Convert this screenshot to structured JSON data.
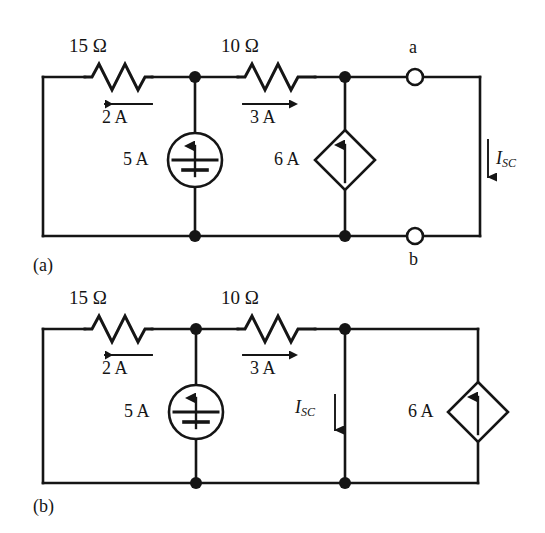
{
  "figure": {
    "type": "circuit-diagram",
    "background": "#ffffff",
    "ink": "#151515",
    "panels": [
      {
        "tag": "(a)",
        "name": "circuit-a",
        "description": "Circuit with open terminals a-b and short-circuit current I_SC in the right branch",
        "components": [
          {
            "name": "resistor-15-ohm",
            "label": "15 Ω",
            "current_label": "2 A",
            "current_direction": "left"
          },
          {
            "name": "resistor-10-ohm",
            "label": "10 Ω",
            "current_label": "3 A",
            "current_direction": "right"
          },
          {
            "name": "independent-current-source",
            "label": "5 A",
            "symbol": "circle-battery-arrow",
            "arrow_direction": "up"
          },
          {
            "name": "dependent-current-source",
            "label": "6 A",
            "symbol": "diamond-arrow",
            "arrow_direction": "up"
          }
        ],
        "terminals": [
          {
            "name": "terminal-a",
            "label": "a"
          },
          {
            "name": "terminal-b",
            "label": "b"
          }
        ],
        "branch_current": {
          "name": "isc-right-branch",
          "label": "I",
          "subscript": "SC",
          "arrow_direction": "down",
          "label_side": "right"
        }
      },
      {
        "tag": "(b)",
        "name": "circuit-b",
        "description": "Same circuit with terminals shorted; I_SC flows in the shorting branch and the 6 A dependent source moved to the far right",
        "components": [
          {
            "name": "resistor-15-ohm",
            "label": "15 Ω",
            "current_label": "2 A",
            "current_direction": "left"
          },
          {
            "name": "resistor-10-ohm",
            "label": "10 Ω",
            "current_label": "3 A",
            "current_direction": "right"
          },
          {
            "name": "independent-current-source",
            "label": "5 A",
            "symbol": "circle-battery-arrow",
            "arrow_direction": "up"
          },
          {
            "name": "dependent-current-source",
            "label": "6 A",
            "symbol": "diamond-arrow",
            "arrow_direction": "up"
          }
        ],
        "terminals": [],
        "branch_current": {
          "name": "isc-short-branch",
          "label": "I",
          "subscript": "SC",
          "arrow_direction": "down",
          "label_side": "left"
        }
      }
    ]
  },
  "labels": {
    "a": {
      "r15": "15 Ω",
      "r10": "10 Ω",
      "i2": "2 A",
      "i3": "3 A",
      "src5": "5 A",
      "src6": "6 A",
      "term_a": "a",
      "term_b": "b",
      "isc": "I",
      "isc_sub": "SC",
      "tag": "(a)"
    },
    "b": {
      "r15": "15 Ω",
      "r10": "10 Ω",
      "i2": "2 A",
      "i3": "3 A",
      "src5": "5 A",
      "src6": "6 A",
      "isc": "I",
      "isc_sub": "SC",
      "tag": "(b)"
    }
  }
}
